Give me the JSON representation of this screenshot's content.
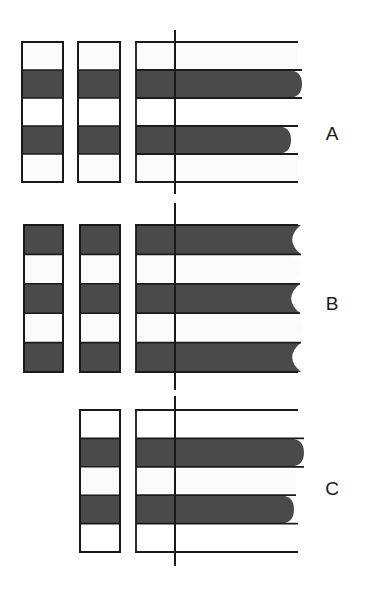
{
  "figure": {
    "title": "",
    "background_color": "#ffffff",
    "dark_band_color": "#4a4a4a",
    "light_band_color": "#fbfbfb",
    "white_band_color": "#ffffff",
    "outline_color": "#1a1a1a",
    "axis_color": "#1a1a1a",
    "width": 372,
    "height": 589
  },
  "panels": [
    {
      "id": "panel-a",
      "label": "A",
      "label_x": 332,
      "label_y": 135,
      "top": 42,
      "bottom": 182,
      "columns": [
        {
          "id": "col-a-1",
          "kind": "band-column",
          "x": 22,
          "width": 41,
          "bands": [
            {
              "fill": "light",
              "height_fraction": 0.2
            },
            {
              "fill": "dark",
              "height_fraction": 0.2
            },
            {
              "fill": "white",
              "height_fraction": 0.2
            },
            {
              "fill": "dark",
              "height_fraction": 0.2
            },
            {
              "fill": "light",
              "height_fraction": 0.2
            }
          ]
        },
        {
          "id": "col-a-2",
          "kind": "band-column",
          "x": 78,
          "width": 42,
          "bands": [
            {
              "fill": "light",
              "height_fraction": 0.2
            },
            {
              "fill": "dark",
              "height_fraction": 0.2
            },
            {
              "fill": "white",
              "height_fraction": 0.2
            },
            {
              "fill": "dark",
              "height_fraction": 0.2
            },
            {
              "fill": "light",
              "height_fraction": 0.2
            }
          ]
        }
      ],
      "chart": {
        "id": "chart-a",
        "x": 136,
        "width_axis": 162,
        "vline_x": 175,
        "vline_overshoot_top": 12,
        "vline_overshoot_bottom": 12,
        "bars": [
          {
            "index": 0,
            "fill": "light",
            "extent": 162,
            "tip": "flat"
          },
          {
            "index": 1,
            "fill": "dark",
            "extent": 166,
            "tip": "round"
          },
          {
            "index": 2,
            "fill": "white",
            "extent": 162,
            "tip": "flat"
          },
          {
            "index": 3,
            "fill": "dark",
            "extent": 155,
            "tip": "round"
          },
          {
            "index": 4,
            "fill": "light",
            "extent": 162,
            "tip": "flat"
          }
        ]
      }
    },
    {
      "id": "panel-b",
      "label": "B",
      "label_x": 332,
      "label_y": 305,
      "top": 225,
      "bottom": 372,
      "columns": [
        {
          "id": "col-b-1",
          "kind": "band-column",
          "x": 24,
          "width": 39,
          "bands": [
            {
              "fill": "dark",
              "height_fraction": 0.2
            },
            {
              "fill": "light",
              "height_fraction": 0.2
            },
            {
              "fill": "dark",
              "height_fraction": 0.2
            },
            {
              "fill": "light",
              "height_fraction": 0.2
            },
            {
              "fill": "dark",
              "height_fraction": 0.2
            }
          ]
        },
        {
          "id": "col-b-2",
          "kind": "band-column",
          "x": 80,
          "width": 40,
          "bands": [
            {
              "fill": "dark",
              "height_fraction": 0.2
            },
            {
              "fill": "light",
              "height_fraction": 0.2
            },
            {
              "fill": "dark",
              "height_fraction": 0.2
            },
            {
              "fill": "light",
              "height_fraction": 0.2
            },
            {
              "fill": "dark",
              "height_fraction": 0.2
            }
          ]
        }
      ],
      "chart": {
        "id": "chart-b",
        "x": 136,
        "width_axis": 162,
        "vline_x": 175,
        "vline_overshoot_top": 22,
        "vline_overshoot_bottom": 18,
        "bars": [
          {
            "index": 0,
            "fill": "dark",
            "extent": 165,
            "tip": "notch"
          },
          {
            "index": 1,
            "fill": "light",
            "extent": 155,
            "tip": "bulge"
          },
          {
            "index": 2,
            "fill": "dark",
            "extent": 164,
            "tip": "notch"
          },
          {
            "index": 3,
            "fill": "light",
            "extent": 157,
            "tip": "bulge"
          },
          {
            "index": 4,
            "fill": "dark",
            "extent": 165,
            "tip": "notch"
          }
        ]
      }
    },
    {
      "id": "panel-c",
      "label": "C",
      "label_x": 332,
      "label_y": 490,
      "top": 410,
      "bottom": 552,
      "columns": [
        {
          "id": "col-c-2",
          "kind": "band-column",
          "x": 80,
          "width": 40,
          "bands": [
            {
              "fill": "white",
              "height_fraction": 0.2
            },
            {
              "fill": "dark",
              "height_fraction": 0.2
            },
            {
              "fill": "light",
              "height_fraction": 0.2
            },
            {
              "fill": "dark",
              "height_fraction": 0.2
            },
            {
              "fill": "white",
              "height_fraction": 0.2
            }
          ]
        }
      ],
      "chart": {
        "id": "chart-c",
        "x": 136,
        "width_axis": 162,
        "vline_x": 175,
        "vline_overshoot_top": 14,
        "vline_overshoot_bottom": 14,
        "bars": [
          {
            "index": 0,
            "fill": "white",
            "extent": 162,
            "tip": "flat"
          },
          {
            "index": 1,
            "fill": "dark",
            "extent": 168,
            "tip": "round"
          },
          {
            "index": 2,
            "fill": "light",
            "extent": 160,
            "tip": "flat"
          },
          {
            "index": 3,
            "fill": "dark",
            "extent": 158,
            "tip": "round"
          },
          {
            "index": 4,
            "fill": "white",
            "extent": 162,
            "tip": "flat"
          }
        ]
      }
    }
  ],
  "chart_data": {
    "type": "bar",
    "title": "",
    "xlabel": "",
    "ylabel": "",
    "orientation": "horizontal",
    "grid": false,
    "legend": null,
    "panels": [
      {
        "name": "A",
        "categories": [
          "1",
          "2",
          "3",
          "4",
          "5"
        ],
        "values": [
          162,
          166,
          162,
          155,
          162
        ],
        "band_fills": [
          "light",
          "dark",
          "white",
          "dark",
          "light"
        ]
      },
      {
        "name": "B",
        "categories": [
          "1",
          "2",
          "3",
          "4",
          "5"
        ],
        "values": [
          165,
          155,
          164,
          157,
          165
        ],
        "band_fills": [
          "dark",
          "light",
          "dark",
          "light",
          "dark"
        ]
      },
      {
        "name": "C",
        "categories": [
          "1",
          "2",
          "3",
          "4",
          "5"
        ],
        "values": [
          162,
          168,
          160,
          158,
          162
        ],
        "band_fills": [
          "white",
          "dark",
          "light",
          "dark",
          "white"
        ]
      }
    ]
  }
}
